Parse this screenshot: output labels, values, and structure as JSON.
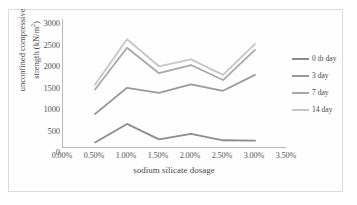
{
  "chart_data": {
    "type": "line",
    "title": "",
    "xlabel": "sodium silicate dosage",
    "ylabel": "unconfined compressive strength (kN/m²)",
    "ylabel_line1": "unconfined compressive",
    "ylabel_line2": "strength (kN/m",
    "ylabel_sup": "2",
    "ylabel_line2_tail": ")",
    "x": [
      0.5,
      1.0,
      1.5,
      2.0,
      2.5,
      3.0
    ],
    "x_display": [
      "0.50%",
      "1.00%",
      "1.50%",
      "2.00%",
      "2.50%",
      "3.00%"
    ],
    "xtick_labels": [
      "0.00%",
      "0.50%",
      "1.00%",
      "1.50%",
      "2.00%",
      "2.50%",
      "3.00%",
      "3.50%"
    ],
    "xtick_values": [
      0.0,
      0.5,
      1.0,
      1.5,
      2.0,
      2.5,
      3.0,
      3.5
    ],
    "xlim": [
      0.0,
      3.5
    ],
    "ytick_labels": [
      "3000",
      "2500",
      "2000",
      "1500",
      "1000",
      "500",
      "0"
    ],
    "ytick_values": [
      3000,
      2500,
      2000,
      1500,
      1000,
      500,
      0
    ],
    "ylim": [
      0,
      3000
    ],
    "grid": false,
    "legend_position": "right",
    "series": [
      {
        "name": "0 th day",
        "color": "#8c8c8c",
        "values": [
          130,
          560,
          200,
          330,
          180,
          170
        ]
      },
      {
        "name": "3 day",
        "color": "#9a9a9a",
        "values": [
          790,
          1400,
          1280,
          1480,
          1330,
          1700
        ]
      },
      {
        "name": "7 day",
        "color": "#a8a8a8",
        "values": [
          1360,
          2330,
          1740,
          1930,
          1580,
          2280
        ]
      },
      {
        "name": "14 day",
        "color": "#c6c6c6",
        "values": [
          1470,
          2530,
          1900,
          2060,
          1700,
          2420
        ]
      }
    ]
  },
  "legend": {
    "items": [
      {
        "label": "0 th day",
        "color": "#8c8c8c"
      },
      {
        "label": "3 day",
        "color": "#9a9a9a"
      },
      {
        "label": "7 day",
        "color": "#a8a8a8"
      },
      {
        "label": "14 day",
        "color": "#c6c6c6"
      }
    ]
  }
}
